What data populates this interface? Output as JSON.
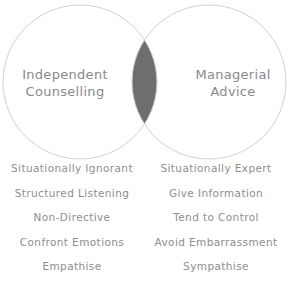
{
  "diagram": {
    "type": "venn",
    "circles": [
      {
        "id": "left",
        "label_lines": [
          "Independent",
          "Counselling"
        ],
        "cx": 80,
        "cy": 82,
        "r": 77
      },
      {
        "id": "right",
        "label_lines": [
          "Managerial",
          "Advice"
        ],
        "cx": 209,
        "cy": 82,
        "r": 77
      }
    ],
    "overlap_fill": "#6e6e6e",
    "stroke_color": "#d0d0d0",
    "text_color": "#8a8a8a"
  },
  "comparison": {
    "rows": [
      {
        "left": "Situationally Ignorant",
        "right": "Situationally Expert"
      },
      {
        "left": "Structured Listening",
        "right": "Give Information"
      },
      {
        "left": "Non-Directive",
        "right": "Tend to Control"
      },
      {
        "left": "Confront Emotions",
        "right": "Avoid Embarrassment"
      },
      {
        "left": "Empathise",
        "right": "Sympathise"
      }
    ]
  }
}
